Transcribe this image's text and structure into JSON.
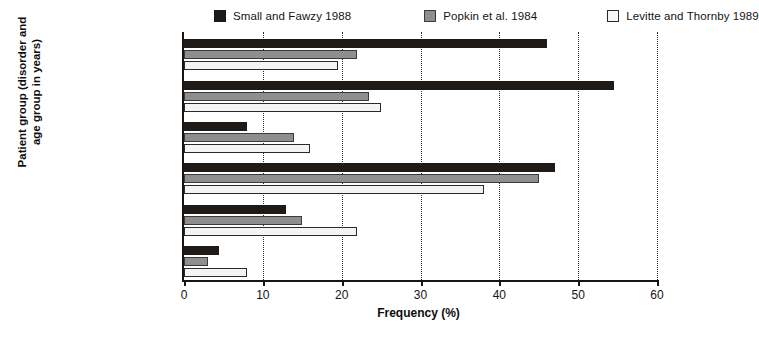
{
  "chart_data": {
    "type": "bar",
    "orientation": "horizontal",
    "title": "",
    "xlabel": "Frequency (%)",
    "ylabel": "Patient group (disorder and age group in years)",
    "xlim": [
      0,
      60
    ],
    "xticks": [
      0,
      10,
      20,
      30,
      40,
      50,
      60
    ],
    "xtick_labels": [
      "0",
      "10",
      "20",
      "30",
      "40",
      "50",
      "60"
    ],
    "grid": "vertical-dotted",
    "legend_position": "top",
    "categories": [
      "Mood (<60)",
      "Mood (>60)",
      "Cognitive (<60)",
      "Cognitive (>60)",
      "Personality (<60)",
      "Personality (>60)"
    ],
    "series": [
      {
        "name": "Small and Fawzy 1988",
        "color": "#201a16",
        "values": [
          46,
          54.5,
          8,
          47,
          13,
          4.5
        ]
      },
      {
        "name": "Popkin et al. 1984",
        "color": "#8e8e8e",
        "values": [
          22,
          23.5,
          14,
          45,
          15,
          3
        ]
      },
      {
        "name": "Levitte and Thornby 1989",
        "color": "#f4f4f4",
        "values": [
          19.5,
          25,
          16,
          38,
          22,
          8
        ]
      }
    ]
  },
  "legend": {
    "items": [
      {
        "label": "Small and Fawzy 1988",
        "swatch": "#201a16"
      },
      {
        "label": "Popkin et al. 1984",
        "swatch": "#8e8e8e"
      },
      {
        "label": "Levitte and Thornby 1989",
        "swatch": "#f4f4f4"
      }
    ]
  },
  "axes": {
    "x_title": "Frequency (%)",
    "y_title_line1": "Patient group (disorder and",
    "y_title_line2": "age group in years)"
  }
}
